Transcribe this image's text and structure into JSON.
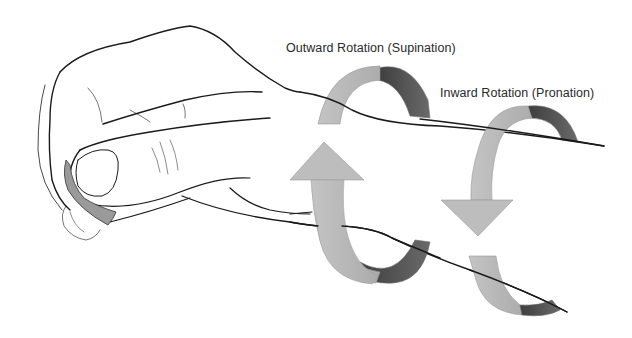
{
  "diagram": {
    "labels": {
      "supination": "Outward Rotation (Supination)",
      "pronation": "Inward Rotation (Pronation)"
    },
    "arrows": [
      {
        "name": "supination-arrow",
        "direction": "up",
        "meaning": "outward rotation"
      },
      {
        "name": "pronation-arrow",
        "direction": "down",
        "meaning": "inward rotation"
      }
    ],
    "colors": {
      "arrow_light": "#b8b8b8",
      "arrow_dark": "#555555",
      "outline": "#1a1a1a",
      "pick": "#9a9a9a",
      "background": "#ffffff"
    }
  }
}
